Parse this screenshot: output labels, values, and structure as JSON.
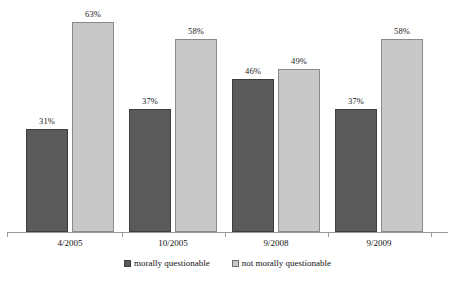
{
  "chart_data": {
    "type": "bar",
    "title": "",
    "subtitle": "",
    "xlabel": "",
    "ylabel": "",
    "categories": [
      "4/2005",
      "10/2005",
      "9/2008",
      "9/2009"
    ],
    "series": [
      {
        "name": "morally questionable",
        "color": "#5a5a5a",
        "values": [
          31,
          37,
          46,
          37
        ],
        "labels": [
          "31%",
          "37%",
          "46%",
          "37%"
        ]
      },
      {
        "name": "not morally questionable",
        "color": "#c8c8c8",
        "values": [
          63,
          58,
          49,
          58
        ],
        "labels": [
          "63%",
          "58%",
          "49%",
          "58%"
        ]
      }
    ],
    "ylim": [
      0,
      70
    ],
    "grid": false,
    "legend_position": "bottom",
    "value_labels": true,
    "y_axis_visible": false,
    "background_color": "#ffffff"
  }
}
